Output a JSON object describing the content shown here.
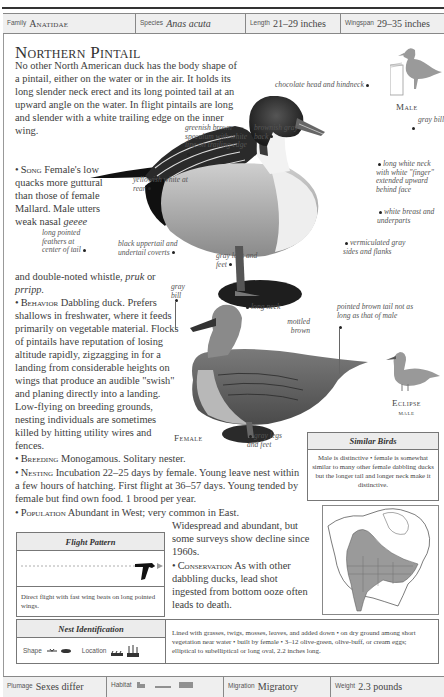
{
  "header": {
    "family_label": "Family",
    "family_value": "Anatidae",
    "species_label": "Species",
    "species_value": "Anas acuta",
    "length_label": "Length",
    "length_value": "21–29 inches",
    "wingspan_label": "Wingspan",
    "wingspan_value": "29–35 inches"
  },
  "title": "Northern Pintail",
  "intro": "No other North American duck has the body shape of a pintail, either on the water or in the air. It holds its long slender neck erect and its long pointed tail at an upward angle on the water. In flight pintails are long and slender with a white trailing edge on the inner wing.",
  "song": {
    "lead": "Song",
    "text_a": "Female's low quacks more guttural than those of female Mallard. Male utters weak nasal",
    "call1": "geeee",
    "text_b": "and double-noted whistle,",
    "call2": "pruk",
    "or": "or",
    "call3": "prripp."
  },
  "behavior": {
    "lead": "Behavior",
    "text": "Dabbling duck. Prefers shallows in freshwater, where it feeds primarily on vegetable material. Flocks of pintails have reputation of losing altitude rapidly, zigzagging in for a landing from considerable heights on wings that produce an audible \"swish\" and planing directly into a landing. Low-flying on breeding grounds, nesting individuals are sometimes killed by hitting utility wires and fences."
  },
  "breeding": {
    "lead": "Breeding",
    "text": "Monogamous. Solitary nester."
  },
  "nesting": {
    "lead": "Nesting",
    "text": "Incubation 22–25 days by female. Young leave nest within a few hours of hatching. First flight at 36–57 days. Young tended by female but find own food. 1 brood per year."
  },
  "population": {
    "lead": "Population",
    "text_a": "Abundant in West; very common in East.",
    "text_b": "Widespread and abundant, but some surveys show decline since 1960s."
  },
  "conservation": {
    "lead": "Conservation",
    "text": "As with other dabbling ducks, lead shot ingested from bottom ooze often leads to death."
  },
  "male": {
    "label": "Male",
    "annotations": [
      "chocolate head and hindneck",
      "gray bill",
      "greenish brown speculum with white line on trailing edge",
      "brownish gray back",
      "long white neck with white \"finger\" extended upward behind face",
      "yellowish white at rear",
      "white breast and underparts",
      "long pointed feathers at center of tail",
      "black uppertail and undertail coverts",
      "gray legs and feet",
      "vermiculated gray sides and flanks"
    ]
  },
  "female": {
    "label": "Female",
    "annotations": [
      "gray bill",
      "long neck",
      "mottled brown",
      "pointed brown tail not as long as that of male",
      "gray legs and feet"
    ]
  },
  "eclipse": {
    "label_line1": "Eclipse",
    "label_line2": "male"
  },
  "similar_birds": {
    "title": "Similar Birds",
    "text": "Male is distinctive • female is somewhat similar to many other female dabbling ducks but the longer tail and longer neck make it distinctive."
  },
  "flight_pattern": {
    "title": "Flight Pattern",
    "text": "Direct flight with fast wing beats on long pointed wings."
  },
  "nest_identification": {
    "title": "Nest Identification",
    "shape_label": "Shape",
    "location_label": "Location",
    "text": "Lined with grasses, twigs, mosses, leaves, and added down • on dry ground among short vegetation near water • built by female • 3–12 olive-green, olive-buff, or cream eggs; elliptical to subelliptical or long oval, 2.2 inches long."
  },
  "footer": {
    "plumage_label": "Plumage",
    "plumage_value": "Sexes differ",
    "habitat_label": "Habitat",
    "migration_label": "Migration",
    "migration_value": "Migratory",
    "weight_label": "Weight",
    "weight_value": "2.3 pounds"
  },
  "colors": {
    "text": "#3d3d3d",
    "rule": "#333333",
    "box_header_bg": "#ececec",
    "range_fill": "#9a9a9a"
  }
}
